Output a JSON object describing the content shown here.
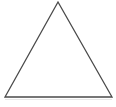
{
  "canvas": {
    "width": 116,
    "height": 107,
    "background_color": "#ffffff"
  },
  "figure": {
    "name": "triangle",
    "fill_color": "#ffffff",
    "stroke_color": "#4a4a4a",
    "stroke_width": 1.3,
    "vertices": [
      {
        "label": "apex",
        "x": 58,
        "y": 2
      },
      {
        "label": "bottom-right",
        "x": 112,
        "y": 97
      },
      {
        "label": "bottom-left",
        "x": 5,
        "y": 97
      }
    ],
    "points_attr": "58,2 112,97 5,97",
    "baseline_artifact": {
      "color": "#e8e8e8",
      "points_attr": "5,99.5 112,99.5"
    }
  }
}
